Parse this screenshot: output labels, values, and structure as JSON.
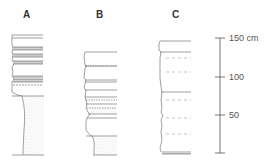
{
  "columns": [
    {
      "label": "A"
    },
    {
      "label": "B"
    },
    {
      "label": "C"
    }
  ],
  "scale": {
    "ticks": [
      {
        "label": "150 cm",
        "value": 150
      },
      {
        "label": "100",
        "value": 100
      },
      {
        "label": "50",
        "value": 50
      },
      {
        "label": "",
        "value": 0
      }
    ]
  },
  "colors": {
    "line": "#777777",
    "hatch": "#9a9a9a",
    "dashed": "#aaaaaa"
  }
}
